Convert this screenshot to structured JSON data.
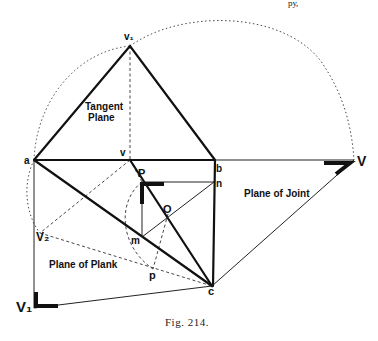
{
  "header": {
    "fragment_text": "ру,"
  },
  "figure": {
    "caption": "Fig. 214.",
    "points": {
      "v1": "v₁",
      "a": "a",
      "v": "v",
      "b": "b",
      "V": "V",
      "P": "P",
      "n": "n",
      "O": "O",
      "m": "m",
      "V2": "V₂",
      "p": "p",
      "c": "c",
      "V1": "V₁"
    },
    "regions": {
      "tangent_plane_line1": "Tangent",
      "tangent_plane_line2": "Plane",
      "plane_of_joint": "Plane of Joint",
      "plane_of_plank": "Plane of Plank"
    }
  }
}
